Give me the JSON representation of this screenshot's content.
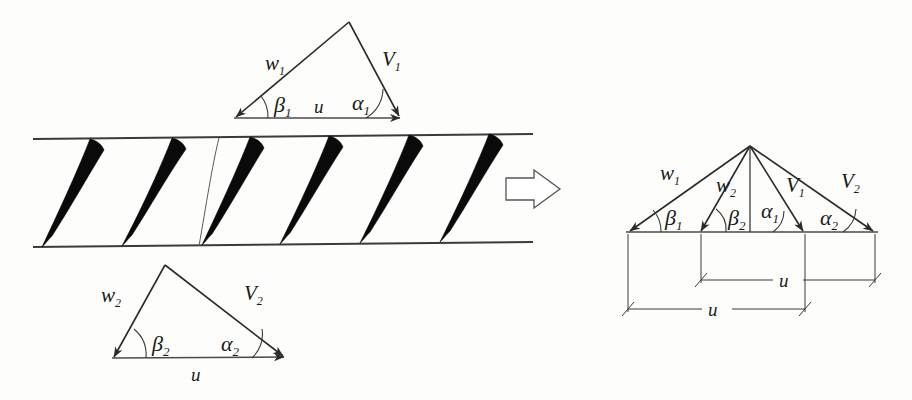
{
  "figure": {
    "type": "engineering-diagram"
  },
  "colors": {
    "blade_fill": "#0a0a0a",
    "line": "#2b2b2b",
    "wall": "#3b3b3b",
    "background": "#fdfdfb"
  },
  "inlet_triangle": {
    "name": "inlet-velocity-triangle",
    "relative_velocity": {
      "symbol": "w",
      "subscript": "1"
    },
    "absolute_velocity": {
      "symbol": "V",
      "subscript": "1"
    },
    "relative_angle": {
      "symbol": "β",
      "subscript": "1"
    },
    "absolute_angle": {
      "symbol": "α",
      "subscript": "1"
    },
    "blade_speed": {
      "symbol": "u"
    }
  },
  "outlet_triangle": {
    "name": "outlet-velocity-triangle",
    "relative_velocity": {
      "symbol": "w",
      "subscript": "2"
    },
    "absolute_velocity": {
      "symbol": "V",
      "subscript": "2"
    },
    "relative_angle": {
      "symbol": "β",
      "subscript": "2"
    },
    "absolute_angle": {
      "symbol": "β",
      "subscript": "2-alt"
    },
    "outlet_absolute_angle": {
      "symbol": "α",
      "subscript": "2"
    },
    "blade_speed": {
      "symbol": "u"
    }
  },
  "cascade": {
    "name": "blade-cascade",
    "blade_count": 6,
    "streamline_count": 1,
    "top_wall_label": "",
    "bottom_wall_label": ""
  },
  "transfer_arrow": {
    "name": "transfer-arrow",
    "direction": "right"
  },
  "combined_diagram": {
    "name": "combined-velocity-triangle",
    "vectors": [
      {
        "symbol": "w",
        "subscript": "1"
      },
      {
        "symbol": "w",
        "subscript": "2"
      },
      {
        "symbol": "V",
        "subscript": "1"
      },
      {
        "symbol": "V",
        "subscript": "2"
      }
    ],
    "angles": [
      {
        "symbol": "β",
        "subscript": "1"
      },
      {
        "symbol": "β",
        "subscript": "2"
      },
      {
        "symbol": "α",
        "subscript": "1"
      },
      {
        "symbol": "α",
        "subscript": "2"
      }
    ],
    "dimensions": [
      {
        "symbol": "u",
        "span": "upper"
      },
      {
        "symbol": "u",
        "span": "lower"
      }
    ]
  },
  "labels": {
    "w1": "w",
    "w1_sub": "1",
    "w2": "w",
    "w2_sub": "2",
    "V1": "V",
    "V1_sub": "1",
    "V2": "V",
    "V2_sub": "2",
    "beta1": "β",
    "beta1_sub": "1",
    "beta2": "β",
    "beta2_sub": "2",
    "alpha1": "α",
    "alpha1_sub": "1",
    "alpha2": "α",
    "alpha2_sub": "2",
    "u": "u"
  }
}
